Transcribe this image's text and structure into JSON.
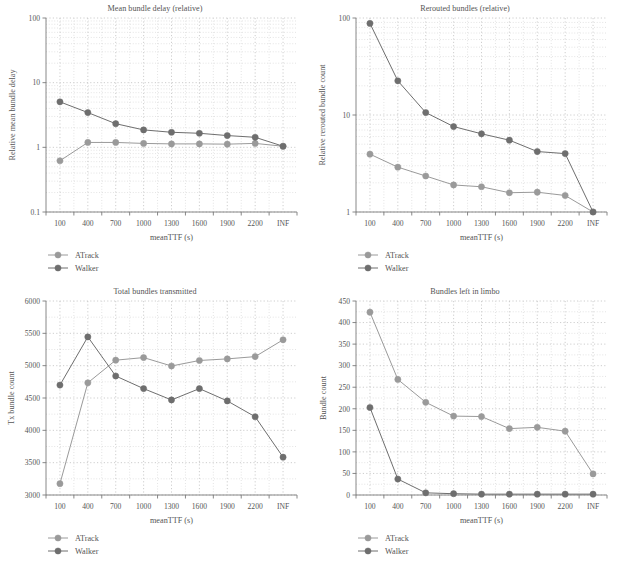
{
  "figure": {
    "width": 620,
    "height": 566,
    "background": "#ffffff"
  },
  "legend": {
    "entries": [
      {
        "label": "ATrack",
        "color": "#9a9a9a"
      },
      {
        "label": "Walker",
        "color": "#6e6e6e"
      }
    ]
  },
  "colors": {
    "atrack": "#9a9a9a",
    "walker": "#6e6e6e",
    "axis": "#7a7a7a",
    "grid": "#cfcfcf",
    "text": "#555555"
  },
  "common": {
    "xlabel": "meanTTF (s)",
    "xticklabels": [
      "100",
      "400",
      "700",
      "1000",
      "1300",
      "1600",
      "1900",
      "2200",
      "INF"
    ]
  },
  "chart_data": [
    {
      "id": "mean-bundle-delay",
      "type": "line",
      "title": "Mean bundle delay (relative)",
      "xlabel": "meanTTF (s)",
      "ylabel": "Relative mean bundle delay",
      "yscale": "log",
      "ylim": [
        0.1,
        100
      ],
      "yticklabels": [
        "0.1",
        "1",
        "10",
        "100"
      ],
      "ytickvalues": [
        0.1,
        1,
        10,
        100
      ],
      "categories": [
        "100",
        "400",
        "700",
        "1000",
        "1300",
        "1600",
        "1900",
        "2200",
        "INF"
      ],
      "grid": true,
      "legend_position": "below-left",
      "series": [
        {
          "name": "ATrack",
          "color": "#9a9a9a",
          "values": [
            0.62,
            1.19,
            1.19,
            1.15,
            1.13,
            1.13,
            1.12,
            1.15,
            1.04
          ]
        },
        {
          "name": "Walker",
          "color": "#6e6e6e",
          "values": [
            5.05,
            3.45,
            2.32,
            1.86,
            1.71,
            1.65,
            1.52,
            1.43,
            1.04
          ]
        }
      ]
    },
    {
      "id": "rerouted-bundles",
      "type": "line",
      "title": "Rerouted bundles (relative)",
      "xlabel": "meanTTF (s)",
      "ylabel": "Relative rerouted bundle count",
      "yscale": "log",
      "ylim": [
        1,
        100
      ],
      "yticklabels": [
        "1",
        "10",
        "100"
      ],
      "ytickvalues": [
        1,
        10,
        100
      ],
      "categories": [
        "100",
        "400",
        "700",
        "1000",
        "1300",
        "1600",
        "1900",
        "2200",
        "INF"
      ],
      "grid": true,
      "legend_position": "below-left",
      "series": [
        {
          "name": "ATrack",
          "color": "#9a9a9a",
          "values": [
            3.95,
            2.9,
            2.35,
            1.9,
            1.82,
            1.58,
            1.6,
            1.48,
            1.0
          ]
        },
        {
          "name": "Walker",
          "color": "#6e6e6e",
          "values": [
            88.0,
            22.5,
            10.6,
            7.6,
            6.4,
            5.5,
            4.2,
            4.0,
            1.0
          ]
        }
      ]
    },
    {
      "id": "total-bundles-transmitted",
      "type": "line",
      "title": "Total bundles transmitted",
      "xlabel": "meanTTF (s)",
      "ylabel": "Tx bundle count",
      "yscale": "linear",
      "ylim": [
        3000,
        6000
      ],
      "yticklabels": [
        "3000",
        "3500",
        "4000",
        "4500",
        "5000",
        "5500",
        "6000"
      ],
      "ytickvalues": [
        3000,
        3500,
        4000,
        4500,
        5000,
        5500,
        6000
      ],
      "categories": [
        "100",
        "400",
        "700",
        "1000",
        "1300",
        "1600",
        "1900",
        "2200",
        "INF"
      ],
      "grid": true,
      "legend_position": "below-left",
      "series": [
        {
          "name": "ATrack",
          "color": "#9a9a9a",
          "values": [
            3175,
            4735,
            5085,
            5125,
            4995,
            5080,
            5105,
            5140,
            5400
          ]
        },
        {
          "name": "Walker",
          "color": "#6e6e6e",
          "values": [
            4700,
            5445,
            4840,
            4645,
            4470,
            4645,
            4455,
            4210,
            3585
          ]
        }
      ]
    },
    {
      "id": "bundles-left-in-limbo",
      "type": "line",
      "title": "Bundles left in limbo",
      "xlabel": "meanTTF (s)",
      "ylabel": "Bundle count",
      "yscale": "linear",
      "ylim": [
        0,
        450
      ],
      "yticklabels": [
        "0",
        "50",
        "100",
        "150",
        "200",
        "250",
        "300",
        "350",
        "400",
        "450"
      ],
      "ytickvalues": [
        0,
        50,
        100,
        150,
        200,
        250,
        300,
        350,
        400,
        450
      ],
      "categories": [
        "100",
        "400",
        "700",
        "1000",
        "1300",
        "1600",
        "1900",
        "2200",
        "INF"
      ],
      "grid": true,
      "legend_position": "below-left",
      "series": [
        {
          "name": "ATrack",
          "color": "#9a9a9a",
          "values": [
            424,
            268,
            215,
            183,
            182,
            154,
            157,
            148,
            49
          ]
        },
        {
          "name": "Walker",
          "color": "#6e6e6e",
          "values": [
            203,
            37,
            5,
            3,
            2,
            2,
            2,
            2,
            2
          ]
        }
      ]
    }
  ]
}
